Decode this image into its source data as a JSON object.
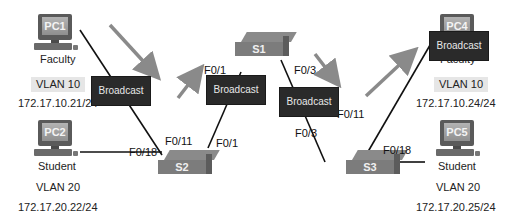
{
  "colors": {
    "background": "#ffffff",
    "link": "#111111",
    "arrow": "#8a8a8a",
    "broadcast_bg": "#2a2a2a",
    "broadcast_text": "#e8e8e8",
    "vlan_label_bg": "#e6e6e6",
    "switch_body": "#7c7c7c",
    "pc_screen": "#a0a0a0"
  },
  "devices": {
    "pc1": {
      "name": "PC1",
      "role": "Faculty",
      "vlan": "VLAN 10",
      "ip": "172.17.10.21/24"
    },
    "pc2": {
      "name": "PC2",
      "role": "Student",
      "vlan": "VLAN 20",
      "ip": "172.17.20.22/24"
    },
    "pc4": {
      "name": "PC4",
      "role": "Faculty",
      "vlan": "VLAN 10",
      "ip": "172.17.10.24/24"
    },
    "pc5": {
      "name": "PC5",
      "role": "Student",
      "vlan": "VLAN 20",
      "ip": "172.17.20.25/24"
    },
    "s1": {
      "name": "S1"
    },
    "s2": {
      "name": "S2"
    },
    "s3": {
      "name": "S3"
    }
  },
  "ports": {
    "s2_f011": "F0/11",
    "s2_f018": "F0/18",
    "s2_f01": "F0/1",
    "s1_f01": "F0/1",
    "s1_f03": "F0/3",
    "s3_f03": "F0/3",
    "s3_f011": "F0/11",
    "s3_f018": "F0/18"
  },
  "broadcast_label": "Broadcast",
  "broadcasts": [
    "Broadcast",
    "Broadcast",
    "Broadcast",
    "Broadcast"
  ]
}
